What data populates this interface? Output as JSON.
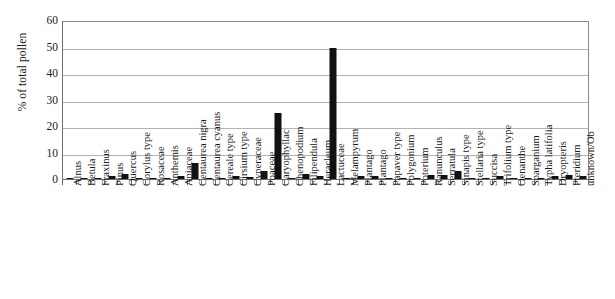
{
  "chart_data": {
    "type": "bar",
    "title": "",
    "xlabel": "",
    "ylabel": "% of total pollen",
    "ylim": [
      0,
      60
    ],
    "ytick_labels": [
      "60",
      "50",
      "40",
      "30",
      "20",
      "10",
      "0"
    ],
    "yticks": [
      60,
      50,
      40,
      30,
      20,
      10,
      0
    ],
    "grid": true,
    "legend": "none",
    "bar_color": "#111111",
    "grid_color": "#b3b3b3",
    "axis_color": "#6e6e6e",
    "categories": [
      "Alnus",
      "Betula",
      "Fraxinus",
      "Pinus",
      "Quercus",
      "Corylus type",
      "Rosaceae",
      "Anthemis",
      "Apiaceae",
      "Centaurea nigra",
      "Centaurea cyanus",
      "Cereale type",
      "Cirsium type",
      "Cyperaceae",
      "Poaceae",
      "Caryophyllac",
      "Chenopodium",
      "Filipendula",
      "Heracleum",
      "Lactuceae",
      "Melampyrum",
      "Plantago",
      "Plantago",
      "Papaver type",
      "Polygonium",
      "Poterium",
      "Ranunculus",
      "Serratula",
      "Sinapis type",
      "Stellaria type",
      "Succisa",
      "Trifolium type",
      "Oenanthe",
      "Sparganium",
      "Typha latifolia",
      "Dryopteris",
      "Pteridium",
      "unknown/Ob"
    ],
    "values": [
      0.2,
      0.2,
      0.2,
      1.2,
      1.8,
      0.2,
      0.2,
      0.2,
      1.0,
      6.0,
      0.3,
      0.2,
      1.0,
      0.8,
      3.0,
      25.0,
      0.4,
      2.0,
      1.3,
      49.5,
      0.2,
      1.2,
      1.2,
      0.2,
      0.2,
      0.2,
      1.5,
      1.5,
      3.0,
      0.2,
      0.2,
      1.0,
      0.2,
      0.2,
      0.2,
      1.0,
      1.5,
      1.0
    ]
  }
}
